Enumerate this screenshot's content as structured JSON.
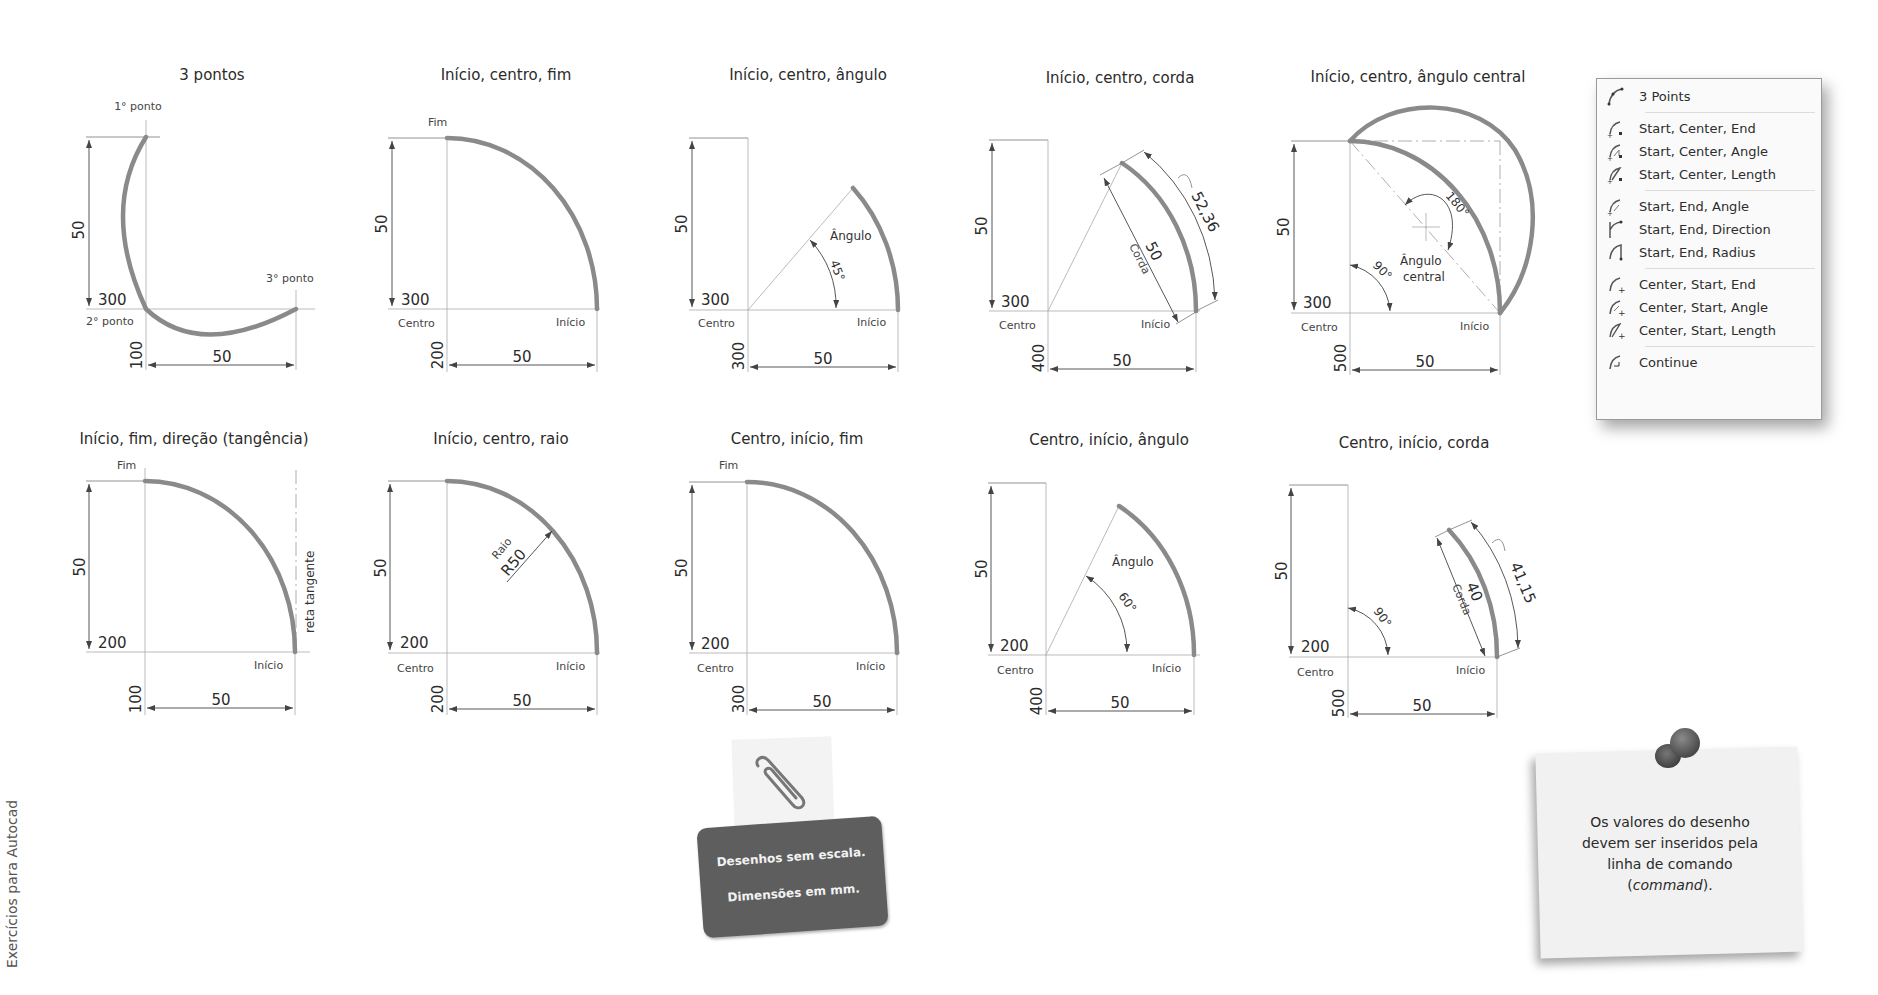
{
  "side_caption": "Exercícios para Autocad",
  "panels": [
    {
      "title": "3 pontos",
      "labels": {
        "p1": "1° ponto",
        "p2": "2° ponto",
        "p3": "3° ponto"
      },
      "dims": {
        "height": "50",
        "y_coord": "300",
        "x_coord": "100",
        "width": "50"
      }
    },
    {
      "title": "Início, centro, fim",
      "labels": {
        "end": "Fim",
        "center": "Centro",
        "start": "Início"
      },
      "dims": {
        "height": "50",
        "y_coord": "300",
        "x_coord": "200",
        "width": "50"
      }
    },
    {
      "title": "Início, centro, ângulo",
      "labels": {
        "angle": "Ângulo",
        "center": "Centro",
        "start": "Início"
      },
      "angle_value": "45°",
      "dims": {
        "height": "50",
        "y_coord": "300",
        "x_coord": "300",
        "width": "50"
      }
    },
    {
      "title": "Início, centro, corda",
      "labels": {
        "chord": "Corda",
        "center": "Centro",
        "start": "Início"
      },
      "chord_value": "50",
      "arc_length": "52,36",
      "dims": {
        "height": "50",
        "y_coord": "300",
        "x_coord": "400",
        "width": "50"
      }
    },
    {
      "title": "Início, centro, ângulo central",
      "labels": {
        "central_angle_1": "Ângulo",
        "central_angle_2": "central",
        "center": "Centro",
        "start": "Início"
      },
      "angle_value": "90°",
      "angle_180": "180°",
      "dims": {
        "height": "50",
        "y_coord": "300",
        "x_coord": "500",
        "width": "50"
      }
    },
    {
      "title": "Início, fim, direção (tangência)",
      "labels": {
        "end": "Fim",
        "start": "Início",
        "tangent": "reta tangente"
      },
      "dims": {
        "height": "50",
        "y_coord": "200",
        "x_coord": "100",
        "width": "50"
      }
    },
    {
      "title": "Início, centro, raio",
      "labels": {
        "radius": "Raio",
        "center": "Centro",
        "start": "Início"
      },
      "radius_value": "R50",
      "dims": {
        "height": "50",
        "y_coord": "200",
        "x_coord": "200",
        "width": "50"
      }
    },
    {
      "title": "Centro, início, fim",
      "labels": {
        "end": "Fim",
        "center": "Centro",
        "start": "Início"
      },
      "dims": {
        "height": "50",
        "y_coord": "200",
        "x_coord": "300",
        "width": "50"
      }
    },
    {
      "title": "Centro, início, ângulo",
      "labels": {
        "angle": "Ângulo",
        "center": "Centro",
        "start": "Início"
      },
      "angle_value": "60°",
      "dims": {
        "height": "50",
        "y_coord": "200",
        "x_coord": "400",
        "width": "50"
      }
    },
    {
      "title": "Centro, início, corda",
      "labels": {
        "chord": "Corda",
        "center": "Centro",
        "start": "Início"
      },
      "angle_value": "90°",
      "chord_value": "40",
      "arc_length": "41,15",
      "dims": {
        "height": "50",
        "y_coord": "200",
        "x_coord": "500",
        "width": "50"
      }
    }
  ],
  "arc_menu": {
    "items": [
      {
        "label": "3 Points",
        "icon": "arc-3points-icon"
      },
      {
        "label": "Start, Center, End",
        "icon": "arc-start-center-end-icon"
      },
      {
        "label": "Start, Center, Angle",
        "icon": "arc-start-center-angle-icon"
      },
      {
        "label": "Start, Center, Length",
        "icon": "arc-start-center-length-icon"
      },
      {
        "label": "Start, End, Angle",
        "icon": "arc-start-end-angle-icon"
      },
      {
        "label": "Start, End, Direction",
        "icon": "arc-start-end-direction-icon"
      },
      {
        "label": "Start, End, Radius",
        "icon": "arc-start-end-radius-icon"
      },
      {
        "label": "Center, Start, End",
        "icon": "arc-center-start-end-icon"
      },
      {
        "label": "Center, Start, Angle",
        "icon": "arc-center-start-angle-icon"
      },
      {
        "label": "Center, Start, Length",
        "icon": "arc-center-start-length-icon"
      },
      {
        "label": "Continue",
        "icon": "arc-continue-icon"
      }
    ]
  },
  "clip_note": {
    "line1": "Desenhos sem escala.",
    "line2": "Dimensões em mm."
  },
  "pin_note": {
    "line1": "Os valores do desenho",
    "line2": "devem ser inseridos pela",
    "line3": "linha de comando",
    "line4_pre": "(",
    "line4_em": "command",
    "line4_post": ")."
  },
  "colors": {
    "arc": "#8a8a8a",
    "card": "#5e5e5e",
    "paper": "#f1f1f1"
  }
}
